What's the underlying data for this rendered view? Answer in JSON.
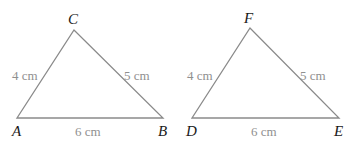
{
  "triangles": [
    {
      "vertices": [
        "A",
        "B",
        "C"
      ],
      "sides": {
        "AC": "4 cm",
        "CB": "5 cm",
        "AB": "6 cm"
      }
    },
    {
      "vertices": [
        "D",
        "E",
        "F"
      ],
      "sides": {
        "DF": "4 cm",
        "FE": "5 cm",
        "DE": "6 cm"
      }
    }
  ]
}
